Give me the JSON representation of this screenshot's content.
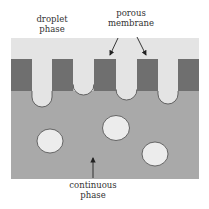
{
  "labels": {
    "droplet_phase": [
      "droplet",
      "phase"
    ],
    "porous_membrane": [
      "porous",
      "membrane"
    ],
    "continuous_phase": [
      "continuous",
      "phase"
    ]
  },
  "colors": {
    "droplet_phase": "#e4e4e4",
    "membrane": "#6f6f6f",
    "continuous_phase": "#a9a9a9",
    "droplet_fill": "#ececec",
    "outline": "#4a4a4a",
    "text": "#333333"
  },
  "membrane_blocks": [
    {
      "x": 11,
      "w": 21
    },
    {
      "x": 52,
      "w": 21
    },
    {
      "x": 94,
      "w": 22
    },
    {
      "x": 137,
      "w": 21
    },
    {
      "x": 178,
      "w": 21
    }
  ],
  "pore_droplets": [
    {
      "x": 32,
      "w": 20,
      "bottom": 107
    },
    {
      "x": 73,
      "w": 21,
      "bottom": 95
    },
    {
      "x": 116,
      "w": 21,
      "bottom": 100
    },
    {
      "x": 158,
      "w": 20,
      "bottom": 104
    }
  ],
  "free_droplets": [
    {
      "cx": 50,
      "cy": 141,
      "rx": 13,
      "ry": 12
    },
    {
      "cx": 116,
      "cy": 128,
      "rx": 13.5,
      "ry": 12.5
    },
    {
      "cx": 155,
      "cy": 154,
      "rx": 13,
      "ry": 12
    }
  ]
}
